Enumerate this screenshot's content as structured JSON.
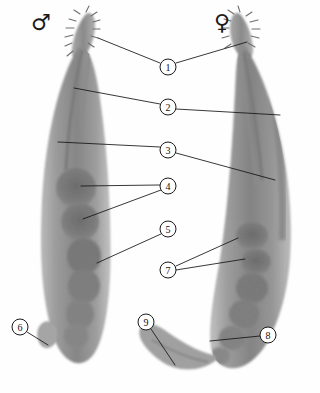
{
  "figure": {
    "background_color": "#fefefe",
    "line_color": "#141414",
    "body_color": "#8f8f8f",
    "organ_color": "#6b6b6b",
    "symbols": [
      {
        "name": "male-symbol",
        "glyph": "♂",
        "x": 31,
        "y": 30,
        "label": "male"
      },
      {
        "name": "female-symbol",
        "glyph": "♀",
        "x": 214,
        "y": 30,
        "label": "female"
      }
    ],
    "callouts": [
      {
        "id": "1",
        "number": "1",
        "cx": 168,
        "cy": 67,
        "r": 8,
        "leaders": [
          [
            [
              160,
              63
            ],
            [
              98,
              38
            ]
          ],
          [
            [
              176,
              63
            ],
            [
              247,
              42
            ]
          ]
        ]
      },
      {
        "id": "2",
        "number": "2",
        "cx": 168,
        "cy": 107,
        "r": 8,
        "leaders": [
          [
            [
              160,
              104
            ],
            [
              74,
              88
            ]
          ],
          [
            [
              176,
              109
            ],
            [
              280,
              115
            ]
          ]
        ]
      },
      {
        "id": "3",
        "number": "3",
        "cx": 168,
        "cy": 150,
        "r": 8,
        "leaders": [
          [
            [
              160,
              147
            ],
            [
              58,
              142
            ]
          ],
          [
            [
              176,
              153
            ],
            [
              275,
              180
            ]
          ]
        ]
      },
      {
        "id": "4",
        "number": "4",
        "cx": 168,
        "cy": 186,
        "r": 8,
        "leaders": [
          [
            [
              160,
              185
            ],
            [
              81,
              186
            ]
          ],
          [
            [
              161,
              190
            ],
            [
              83,
              219
            ]
          ]
        ]
      },
      {
        "id": "5",
        "number": "5",
        "cx": 168,
        "cy": 229,
        "r": 8,
        "leaders": [
          [
            [
              161,
              234
            ],
            [
              97,
              263
            ]
          ]
        ]
      },
      {
        "id": "6",
        "number": "6",
        "cx": 20,
        "cy": 327,
        "r": 8,
        "leaders": [
          [
            [
              27,
              332
            ],
            [
              48,
              345
            ]
          ]
        ]
      },
      {
        "id": "7",
        "number": "7",
        "cx": 168,
        "cy": 270,
        "r": 8,
        "leaders": [
          [
            [
              176,
              266
            ],
            [
              238,
              238
            ]
          ],
          [
            [
              176,
              270
            ],
            [
              245,
              259
            ]
          ]
        ]
      },
      {
        "id": "8",
        "number": "8",
        "cx": 268,
        "cy": 335,
        "r": 8,
        "leaders": [
          [
            [
              260,
              336
            ],
            [
              210,
              341
            ]
          ]
        ]
      },
      {
        "id": "9",
        "number": "9",
        "cx": 146,
        "cy": 322,
        "r": 8,
        "leaders": [
          [
            [
              151,
              329
            ],
            [
              175,
              365
            ]
          ]
        ]
      }
    ]
  }
}
